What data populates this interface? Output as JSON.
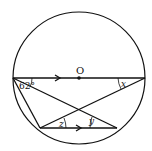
{
  "diagram": {
    "center_label": "O",
    "angle_given": "62°",
    "angle_x": "x",
    "angle_y": "y",
    "angle_z": "z",
    "stroke_color": "#111111",
    "background": "#ffffff"
  }
}
